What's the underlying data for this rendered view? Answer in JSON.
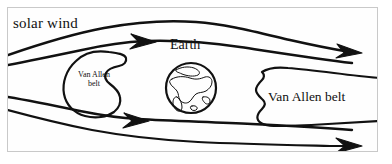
{
  "figure": {
    "background_color": "#ffffff",
    "frame_color": "#c9c9c9",
    "ink_color": "#111111"
  },
  "labels": {
    "solar_wind": "solar wind",
    "earth": "Earth",
    "belt_left_line1": "Van Allen",
    "belt_left_line2": "belt",
    "belt_right": "Van Allen belt"
  },
  "diagram_data": {
    "type": "schematic",
    "elements": [
      {
        "name": "solar-wind-streamline-1",
        "kind": "flow-line",
        "direction": "left-to-right",
        "arrowhead": "end",
        "arrow_position": "right-edge"
      },
      {
        "name": "solar-wind-streamline-2",
        "kind": "flow-line",
        "direction": "left-to-right",
        "arrowhead": "mid",
        "arrow_position": "left-of-earth"
      },
      {
        "name": "solar-wind-streamline-3",
        "kind": "flow-line",
        "direction": "left-to-right",
        "arrowhead": "mid",
        "arrow_position": "left-of-earth"
      },
      {
        "name": "solar-wind-streamline-4",
        "kind": "flow-line",
        "direction": "left-to-right",
        "arrowhead": "end",
        "arrow_position": "right-edge"
      },
      {
        "name": "van-allen-belt-left",
        "kind": "closed-region",
        "shape": "crescent"
      },
      {
        "name": "earth-globe",
        "kind": "circle",
        "center_x": 191,
        "center_y": 88,
        "radius": 25
      },
      {
        "name": "van-allen-belt-right",
        "kind": "closed-region",
        "shape": "elongated-blob",
        "clipped_at_right_edge": true
      }
    ]
  }
}
